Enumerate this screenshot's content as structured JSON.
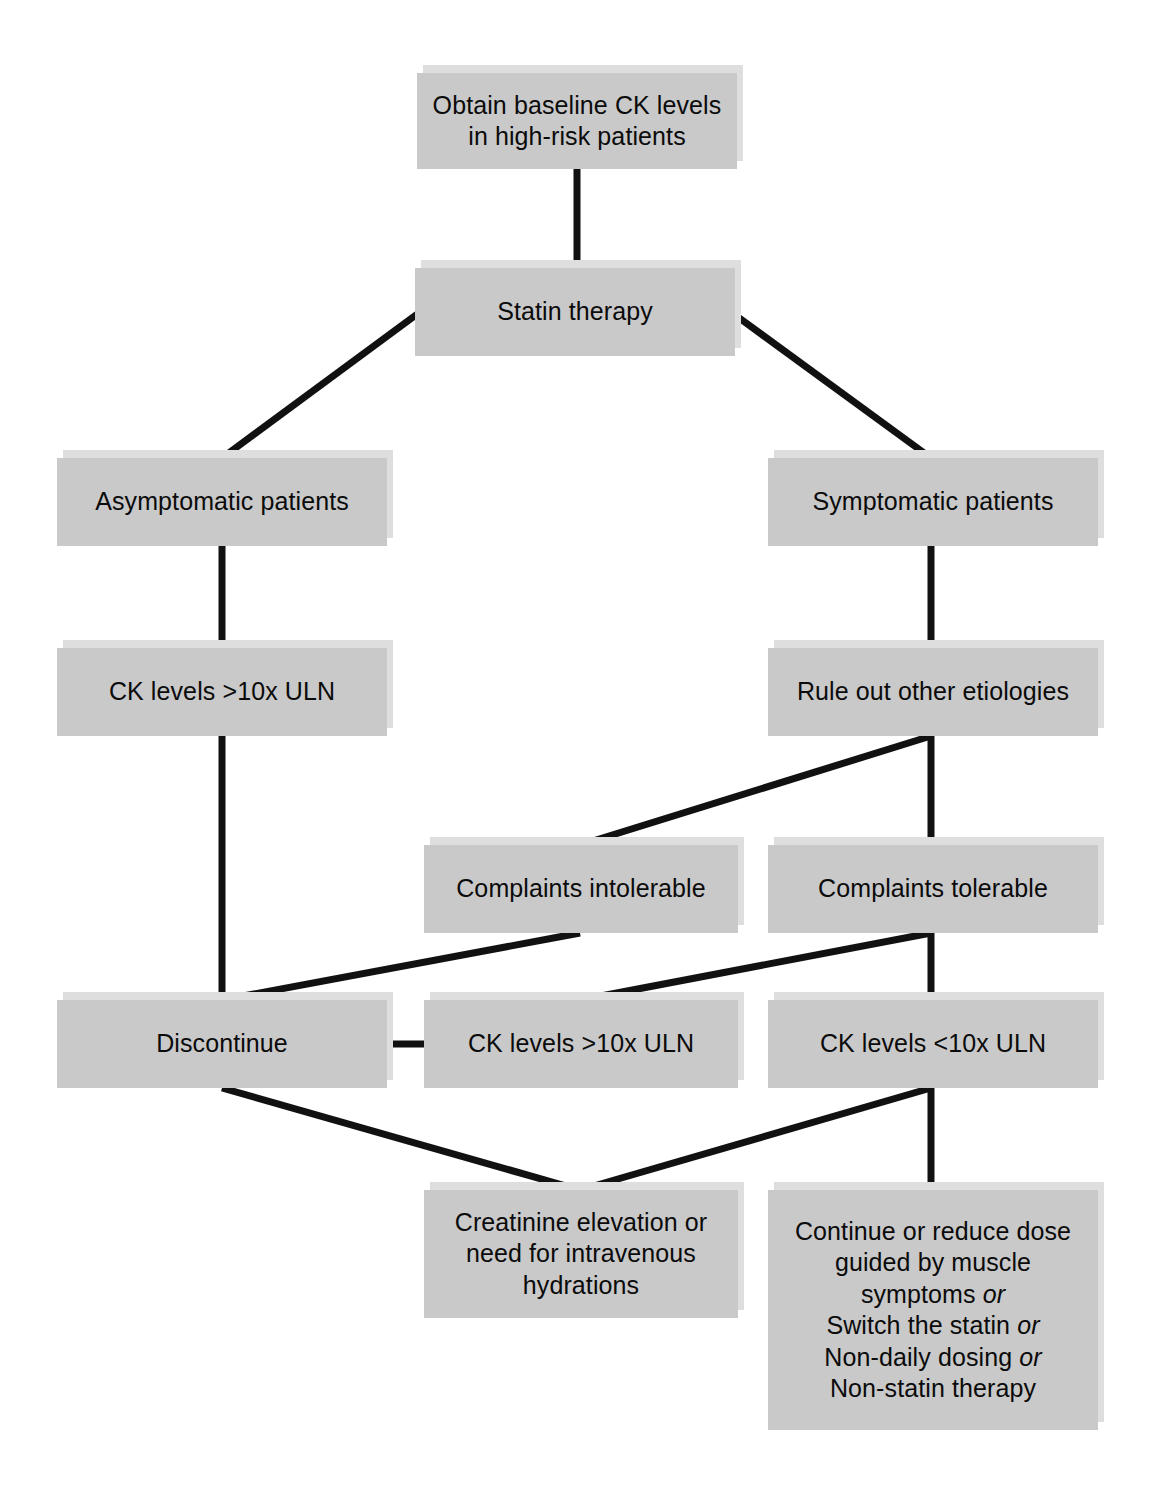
{
  "diagram": {
    "type": "flowchart",
    "background_color": "#ffffff",
    "node_fill_color": "#c9c9c9",
    "node_shadow_color": "#dedede",
    "edge_color": "#111111",
    "text_color": "#0b0b0b",
    "nodes": [
      {
        "id": "baseline-ck",
        "label": "Obtain baseline CK levels\nin high-risk patients",
        "x": 417,
        "y": 73,
        "w": 320,
        "h": 96
      },
      {
        "id": "statin-therapy",
        "label": "Statin therapy",
        "x": 415,
        "y": 268,
        "w": 320,
        "h": 88
      },
      {
        "id": "asymptomatic-patients",
        "label": "Asymptomatic patients",
        "x": 57,
        "y": 458,
        "w": 330,
        "h": 88
      },
      {
        "id": "symptomatic-patients",
        "label": "Symptomatic patients",
        "x": 768,
        "y": 458,
        "w": 330,
        "h": 88
      },
      {
        "id": "ck-high-left",
        "label": "CK levels >10x ULN",
        "x": 57,
        "y": 648,
        "w": 330,
        "h": 88
      },
      {
        "id": "rule-out-etiologies",
        "label": "Rule out other etiologies",
        "x": 768,
        "y": 648,
        "w": 330,
        "h": 88
      },
      {
        "id": "complaints-intolerable",
        "label": "Complaints intolerable",
        "x": 424,
        "y": 845,
        "w": 314,
        "h": 88
      },
      {
        "id": "complaints-tolerable",
        "label": "Complaints tolerable",
        "x": 768,
        "y": 845,
        "w": 330,
        "h": 88
      },
      {
        "id": "discontinue",
        "label": "Discontinue",
        "x": 57,
        "y": 1000,
        "w": 330,
        "h": 88
      },
      {
        "id": "ck-high-mid",
        "label": "CK levels >10x ULN",
        "x": 424,
        "y": 1000,
        "w": 314,
        "h": 88
      },
      {
        "id": "ck-low-right",
        "label": "CK levels <10x ULN",
        "x": 768,
        "y": 1000,
        "w": 330,
        "h": 88
      },
      {
        "id": "creatinine-elevation",
        "label": "Creatinine elevation or\nneed for intravenous\nhydrations",
        "x": 424,
        "y": 1190,
        "w": 314,
        "h": 128
      },
      {
        "id": "continue-or-reduce",
        "label_lines": [
          "Continue or reduce dose",
          "guided by muscle",
          "symptoms or",
          "Switch the statin or",
          "Non-daily dosing or",
          "Non-statin therapy"
        ],
        "label": "Continue or reduce dose\nguided by muscle\nsymptoms or\nSwitch the statin or\nNon-daily dosing or\nNon-statin therapy",
        "x": 768,
        "y": 1190,
        "w": 330,
        "h": 240
      }
    ],
    "edges": [
      {
        "id": "e1",
        "from": "baseline-ck",
        "to": "statin-therapy",
        "kind": "vertical"
      },
      {
        "id": "e2",
        "from": "statin-therapy",
        "to": "asymptomatic-patients",
        "kind": "diagonal"
      },
      {
        "id": "e3",
        "from": "statin-therapy",
        "to": "symptomatic-patients",
        "kind": "diagonal"
      },
      {
        "id": "e4",
        "from": "asymptomatic-patients",
        "to": "ck-high-left",
        "kind": "vertical"
      },
      {
        "id": "e5",
        "from": "symptomatic-patients",
        "to": "rule-out-etiologies",
        "kind": "vertical"
      },
      {
        "id": "e6",
        "from": "rule-out-etiologies",
        "to": "complaints-intolerable",
        "kind": "diagonal"
      },
      {
        "id": "e7",
        "from": "rule-out-etiologies",
        "to": "complaints-tolerable",
        "kind": "vertical"
      },
      {
        "id": "e8",
        "from": "ck-high-left",
        "to": "discontinue",
        "kind": "vertical"
      },
      {
        "id": "e9",
        "from": "complaints-intolerable",
        "to": "discontinue",
        "kind": "diagonal"
      },
      {
        "id": "e10",
        "from": "complaints-tolerable",
        "to": "ck-high-mid",
        "kind": "diagonal"
      },
      {
        "id": "e11",
        "from": "complaints-tolerable",
        "to": "ck-low-right",
        "kind": "vertical"
      },
      {
        "id": "e12",
        "from": "discontinue",
        "to": "ck-high-mid",
        "kind": "horizontal"
      },
      {
        "id": "e13",
        "from": "discontinue",
        "to": "creatinine-elevation",
        "kind": "diagonal"
      },
      {
        "id": "e14",
        "from": "ck-low-right",
        "to": "creatinine-elevation",
        "kind": "diagonal"
      },
      {
        "id": "e15",
        "from": "ck-low-right",
        "to": "continue-or-reduce",
        "kind": "vertical"
      }
    ]
  }
}
